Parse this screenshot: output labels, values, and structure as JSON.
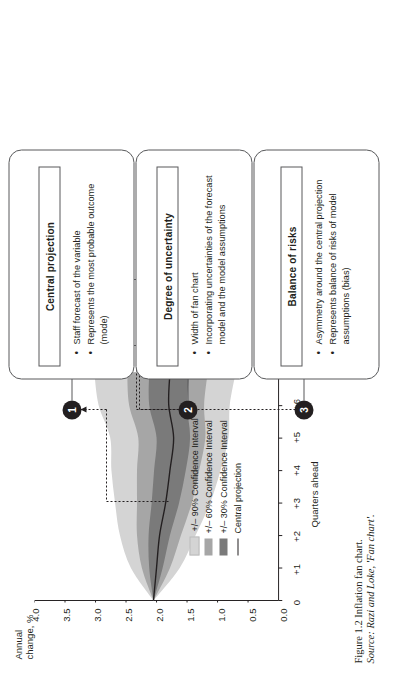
{
  "figure": {
    "caption": "Figure 1.2  Inflation fan chart.",
    "source": "Source: Razi and Loke, 'Fan chart'."
  },
  "chart_data": {
    "type": "area",
    "title": "",
    "xlabel": "Quarters ahead",
    "ylabel": "Annual change, %",
    "ylim": [
      0.0,
      4.0
    ],
    "yticks": [
      "0.0",
      "0.5",
      "1.0",
      "1.5",
      "2.0",
      "2.5",
      "3.0",
      "3.5",
      "4.0"
    ],
    "xticks": [
      "0",
      "+1",
      "+2",
      "+3",
      "+4",
      "+5",
      "+6",
      "+7"
    ],
    "x": [
      0,
      1,
      2,
      3,
      4,
      5,
      6,
      7
    ],
    "grid": false,
    "legend_position": "inside-lower-left",
    "series": [
      {
        "name": "Central projection",
        "values": [
          2.05,
          2.0,
          1.95,
          1.85,
          1.78,
          1.72,
          1.8,
          1.78
        ],
        "color": "#231f20",
        "kind": "line"
      },
      {
        "name": "+/- 30% Confidence Interval",
        "lower": [
          2.05,
          1.9,
          1.78,
          1.63,
          1.52,
          1.45,
          1.5,
          1.46
        ],
        "upper": [
          2.05,
          2.12,
          2.13,
          2.08,
          2.04,
          2.0,
          2.12,
          2.12
        ],
        "color": "#7a7a7a",
        "kind": "band"
      },
      {
        "name": "+/- 60% Confidence Interval",
        "lower": [
          2.05,
          1.78,
          1.6,
          1.42,
          1.3,
          1.2,
          1.22,
          1.16
        ],
        "upper": [
          2.05,
          2.24,
          2.32,
          2.32,
          2.32,
          2.3,
          2.45,
          2.48
        ],
        "color": "#a6a6a6",
        "kind": "band"
      },
      {
        "name": "+/- 90% Confidence Interval",
        "lower": [
          2.05,
          1.62,
          1.36,
          1.12,
          0.95,
          0.82,
          0.8,
          0.7
        ],
        "upper": [
          2.05,
          2.42,
          2.6,
          2.68,
          2.74,
          2.76,
          2.95,
          3.02
        ],
        "color": "#d4d4d4",
        "kind": "band"
      }
    ],
    "legend": [
      {
        "label": "+/– 90% Confidence Interval",
        "color": "#d4d4d4",
        "swatch": "fill"
      },
      {
        "label": "+/– 60% Confidence Interval",
        "color": "#a6a6a6",
        "swatch": "fill"
      },
      {
        "label": "+/– 30% Confidence Interval",
        "color": "#7a7a7a",
        "swatch": "fill"
      },
      {
        "label": "Central projection",
        "color": "#231f20",
        "swatch": "line"
      }
    ]
  },
  "callouts": [
    {
      "number": "1",
      "title": "Central projection",
      "bullets": [
        "Staff forecast of the variable",
        "Represents the most probable outcome (mode)"
      ]
    },
    {
      "number": "2",
      "title": "Degree of uncertainty",
      "bullets": [
        "Width of fan chart",
        "Incorporating uncertainties of the forecast model and the model assumptions"
      ]
    },
    {
      "number": "3",
      "title": "Balance of risks",
      "bullets": [
        "Asymmetry around the central projection",
        "Represents balance of risks of model assumptions (bias)"
      ]
    }
  ],
  "colors": {
    "band90": "#d4d4d4",
    "band60": "#a6a6a6",
    "band30": "#7a7a7a",
    "central": "#231f20",
    "outline": "#58595b"
  }
}
